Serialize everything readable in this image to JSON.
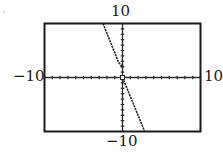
{
  "chart_data": {
    "type": "line",
    "title": "",
    "xlabel": "",
    "ylabel": "",
    "xlim": [
      -10,
      10
    ],
    "ylim": [
      -10,
      10
    ],
    "xscale_ticks": 1,
    "yscale_ticks": 1,
    "grid": false,
    "window_labels": {
      "ymax": "10",
      "ymin": "-10",
      "xmin": "-10",
      "xmax": "10"
    },
    "series": [
      {
        "name": "upper piece (x < 0)",
        "style": "dotted calculator pixels",
        "points": [
          [
            -2.5,
            10
          ],
          [
            -0.5,
            2.8
          ],
          [
            -0.05,
            2.1
          ]
        ],
        "endpoint_marker": "closed dot near (0, 2.1)"
      },
      {
        "name": "lower piece (x >= 0)",
        "style": "dotted calculator pixels",
        "points": [
          [
            0,
            0
          ],
          [
            2.85,
            -10
          ]
        ],
        "endpoint_marker": "open square at (0, 0)"
      }
    ],
    "approx_slope": -3.5,
    "legend": null
  },
  "labels": {
    "top": "10",
    "bottom": "−10",
    "left": "−10",
    "right": "10"
  },
  "colors": {
    "frame": "#1a1a1a",
    "axis": "#2a2a2a",
    "curve": "#2a2a2a",
    "background": "#ffffff"
  }
}
